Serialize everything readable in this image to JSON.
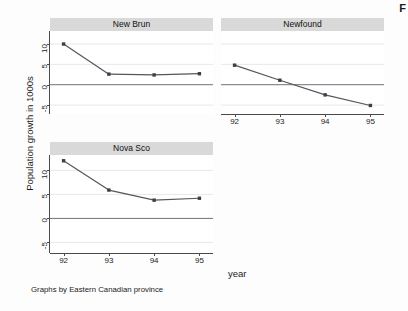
{
  "figure": {
    "edge_glyph": "F",
    "ylabel": "Population growth in 1000s",
    "xlabel": "year",
    "caption": "Graphs by Eastern Canadian province",
    "grid_color": "#e8e8e8",
    "line_color": "#53565c",
    "marker_color": "#3c3f45",
    "panel_header_color": "#d9d9d9",
    "axis_color": "#4a4a4a",
    "panel_background": "#ffffff",
    "figure_background": "#fdfdfd"
  },
  "chart_data": {
    "type": "line",
    "title": "",
    "subtitle": "",
    "xlabel": "year",
    "ylabel": "Population growth in 1000s",
    "caption": "Graphs by Eastern Canadian province",
    "legend": "none",
    "grid": "horizontal",
    "small_multiples": true,
    "layout": "2 columns x 2 rows, fourth cell empty",
    "x": [
      92,
      93,
      94,
      95
    ],
    "xtick_labels": [
      "92",
      "93",
      "94",
      "95"
    ],
    "xlim": [
      91.7,
      95.3
    ],
    "ytick_values": [
      10,
      5,
      0,
      -5
    ],
    "ytick_labels": [
      "10",
      "5",
      "0",
      "-5"
    ],
    "ylim": [
      -7.2,
      13.2
    ],
    "zero_reference_line": 0,
    "panels": [
      {
        "name": "New Brun",
        "title": "New Brun",
        "position": "top-left",
        "values": [
          10.0,
          2.6,
          2.4,
          2.7
        ]
      },
      {
        "name": "Newfound",
        "title": "Newfound",
        "position": "top-right",
        "values": [
          4.8,
          1.1,
          -2.5,
          -5.1
        ]
      },
      {
        "name": "Nova Sco",
        "title": "Nova Sco",
        "position": "bottom-left",
        "values": [
          12.0,
          5.9,
          3.8,
          4.2
        ]
      }
    ],
    "series": [
      {
        "name": "New Brun",
        "values": [
          10.0,
          2.6,
          2.4,
          2.7
        ]
      },
      {
        "name": "Newfound",
        "values": [
          4.8,
          1.1,
          -2.5,
          -5.1
        ]
      },
      {
        "name": "Nova Sco",
        "values": [
          12.0,
          5.9,
          3.8,
          4.2
        ]
      }
    ]
  }
}
